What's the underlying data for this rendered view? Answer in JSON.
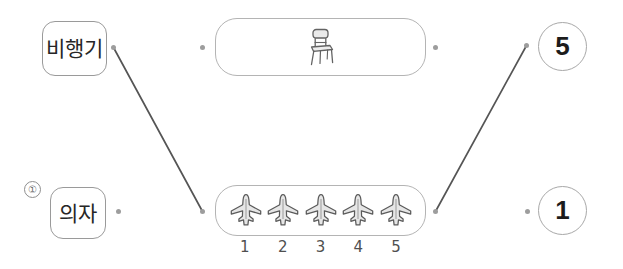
{
  "page": {
    "background_color": "#ffffff",
    "line_color": "#555555",
    "dot_color": "#9d9d9d",
    "box_border_color": "#b4b4b4"
  },
  "question": {
    "marker": "①"
  },
  "word_options": [
    {
      "id": "airplane",
      "label": "비행기"
    },
    {
      "id": "chair",
      "label": "의자"
    }
  ],
  "picture_groups": [
    {
      "id": "chair-group",
      "icon": "chair-icon",
      "count": 1,
      "captions": []
    },
    {
      "id": "airplane-group",
      "icon": "airplane-icon",
      "count": 5,
      "captions": [
        "1",
        "2",
        "3",
        "4",
        "5"
      ]
    }
  ],
  "number_options": [
    {
      "id": "five",
      "label": "5"
    },
    {
      "id": "one",
      "label": "1"
    }
  ],
  "connections": [
    {
      "from": "word-airplane",
      "to": "airplane-group"
    },
    {
      "from": "airplane-group",
      "to": "number-five"
    }
  ]
}
